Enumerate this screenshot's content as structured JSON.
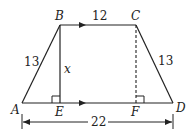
{
  "diagram": {
    "type": "trapezoid",
    "vertices": {
      "A": "A",
      "B": "B",
      "C": "C",
      "D": "D",
      "E": "E",
      "F": "F"
    },
    "labels": {
      "top": "12",
      "left_side": "13",
      "right_side": "13",
      "height": "x",
      "base": "22"
    },
    "colors": {
      "stroke": "#222222",
      "background": "#ffffff"
    }
  }
}
